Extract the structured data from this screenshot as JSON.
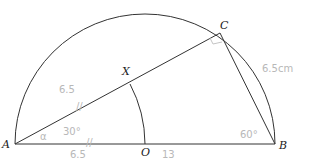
{
  "diagram": {
    "type": "semicircle-geometry",
    "points": {
      "A": {
        "label": "A"
      },
      "B": {
        "label": "B"
      },
      "C": {
        "label": "C"
      },
      "O": {
        "label": "O"
      },
      "X": {
        "label": "X"
      }
    },
    "annotations": {
      "ax_length": "6.5",
      "ao_length": "6.5",
      "ob_length": "13",
      "bc_length": "6.5cm",
      "angle_a": "30°",
      "angle_a_symbol": "α",
      "angle_b": "60°",
      "tick_mark": "//"
    },
    "colors": {
      "line": "#333333",
      "handwriting": "#b8b8b8"
    }
  }
}
